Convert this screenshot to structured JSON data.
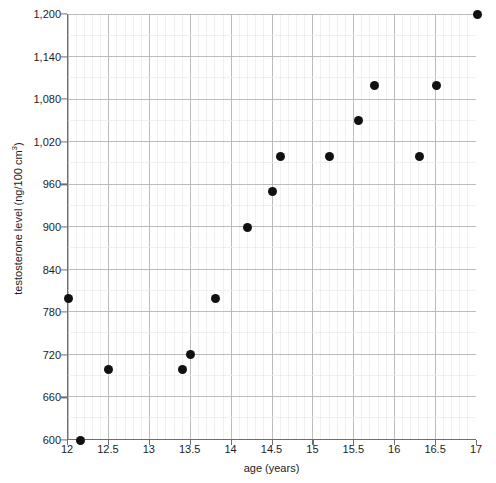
{
  "chart_data": {
    "type": "scatter",
    "title": "",
    "xlabel": "age (years)",
    "ylabel": "testosterone level (ng/100 cm3)",
    "ylabel_base": "testosterone level (ng/100 cm",
    "ylabel_sup": "3",
    "ylabel_tail": ")",
    "xlim": [
      12,
      17
    ],
    "ylim": [
      600,
      1200
    ],
    "x_major_step": 0.5,
    "x_minor_step": 0.1,
    "y_major_step": 60,
    "y_minor_step": 30,
    "grid": true,
    "grid_color_major": "#b4b4b4",
    "grid_color_minor": "#ececec",
    "axis_color": "#6e6e6e",
    "point_color": "#111111",
    "legend": "none",
    "x_tick_labels": [
      "12",
      "12.5",
      "13",
      "13.5",
      "14",
      "14.5",
      "15",
      "15.5",
      "16",
      "16.5",
      "17"
    ],
    "x_tick_values": [
      12,
      12.5,
      13,
      13.5,
      14,
      14.5,
      15,
      15.5,
      16,
      16.5,
      17
    ],
    "y_tick_labels": [
      "600",
      "660",
      "720",
      "780",
      "840",
      "900",
      "960",
      "1,020",
      "1,080",
      "1,140",
      "1,200"
    ],
    "y_tick_values": [
      600,
      660,
      720,
      780,
      840,
      900,
      960,
      1020,
      1080,
      1140,
      1200
    ],
    "points": [
      {
        "x": 12.0,
        "y": 800
      },
      {
        "x": 12.15,
        "y": 600
      },
      {
        "x": 12.5,
        "y": 700
      },
      {
        "x": 13.4,
        "y": 700
      },
      {
        "x": 13.5,
        "y": 720
      },
      {
        "x": 13.8,
        "y": 800
      },
      {
        "x": 14.2,
        "y": 900
      },
      {
        "x": 14.5,
        "y": 950
      },
      {
        "x": 14.6,
        "y": 1000
      },
      {
        "x": 15.2,
        "y": 1000
      },
      {
        "x": 15.55,
        "y": 1050
      },
      {
        "x": 15.75,
        "y": 1100
      },
      {
        "x": 16.3,
        "y": 1000
      },
      {
        "x": 16.5,
        "y": 1100
      },
      {
        "x": 17.0,
        "y": 1200
      }
    ]
  },
  "clipped_header": {
    "fragment_left": "",
    "fragment_center": "",
    "fragment_right": ""
  }
}
